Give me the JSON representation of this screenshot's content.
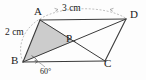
{
  "figure": {
    "type": "geometry-diagram",
    "background_color": "#fdfdfd",
    "stroke_color": "#3a3a3a",
    "shade_color": "#c9c9c9",
    "dash_color": "#9a9a9a"
  },
  "vertices": {
    "a": {
      "label": "A",
      "x": 40,
      "y": 20,
      "label_x": 34,
      "label_y": 7
    },
    "b": {
      "label": "B",
      "x": 23,
      "y": 62,
      "label_x": 12,
      "label_y": 56
    },
    "c": {
      "label": "C",
      "x": 105,
      "y": 61,
      "label_x": 105,
      "label_y": 57
    },
    "d": {
      "label": "D",
      "x": 126,
      "y": 19,
      "label_x": 130,
      "label_y": 10
    },
    "p": {
      "label": "P",
      "x": 74.5,
      "y": 41,
      "label_x": 67,
      "label_y": 34
    }
  },
  "dimensions": {
    "top": {
      "text": "3 cm",
      "x": 73,
      "y": 4,
      "from": "A",
      "to": "D"
    },
    "side": {
      "text": "2 cm",
      "x": 7,
      "y": 29,
      "from": "B",
      "to": "A"
    }
  },
  "angle": {
    "text": "60°",
    "x": 39,
    "y": 68,
    "at_vertex": "B",
    "value": 60,
    "unit": "degrees"
  },
  "shaded_region": {
    "name": "triangle-ABP",
    "points": "A,B,P",
    "fill": "#c9c9c9"
  },
  "edges": [
    {
      "name": "AB",
      "from": "A",
      "to": "B"
    },
    {
      "name": "BC",
      "from": "B",
      "to": "C"
    },
    {
      "name": "CD",
      "from": "C",
      "to": "D"
    },
    {
      "name": "DA",
      "from": "D",
      "to": "A"
    },
    {
      "name": "AC",
      "from": "A",
      "to": "C"
    },
    {
      "name": "BD",
      "from": "B",
      "to": "D"
    }
  ]
}
